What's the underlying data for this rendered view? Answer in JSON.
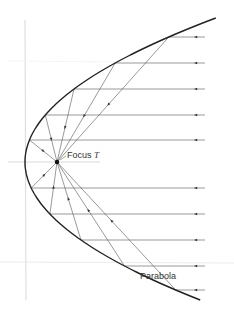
{
  "diagram": {
    "labels": {
      "focus": "Focus",
      "focus_symbol": "T",
      "curve": "Parabola"
    },
    "geometry": {
      "vertex": [
        25,
        162
      ],
      "focus": [
        57,
        162
      ],
      "k": 0.0092,
      "ray_y": [
        37,
        63,
        89,
        115,
        140,
        188,
        214,
        240,
        266,
        290
      ],
      "ray_start_x": 205,
      "arrow_x": 196
    },
    "colors": {
      "curve": "#222222",
      "ray": "#555555",
      "axis": "#bbbbbb",
      "label": "#333333"
    }
  }
}
